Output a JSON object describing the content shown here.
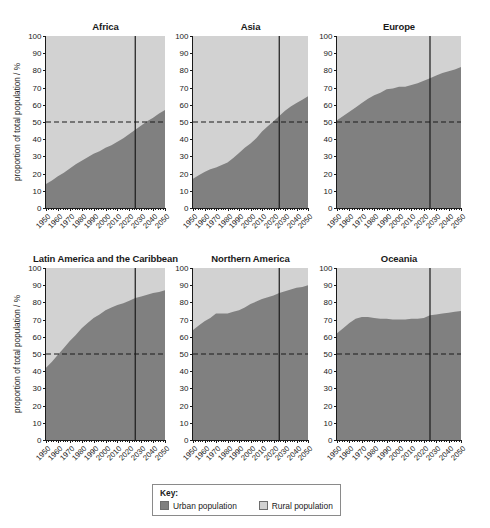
{
  "figure": {
    "ylabel": "proportion of total population / %",
    "y_ticks": [
      "0",
      "10",
      "20",
      "30",
      "40",
      "50",
      "60",
      "70",
      "80",
      "90",
      "100"
    ],
    "x_ticks": [
      "1950",
      "1960",
      "1970",
      "1980",
      "1990",
      "2000",
      "2010",
      "2020",
      "2030",
      "2040",
      "2050"
    ]
  },
  "legend": {
    "title": "Key:",
    "items": [
      {
        "label": "Urban population",
        "color": "#808080"
      },
      {
        "label": "Rural population",
        "color": "#d2d2d2"
      }
    ]
  },
  "colors": {
    "urban": "#808080",
    "rural": "#d2d2d2",
    "axis": "#1a1a1a",
    "reference_line": "#1a1a1a",
    "projection_line": "#1a1a1a"
  },
  "chart_data": [
    {
      "type": "area",
      "title": "Africa",
      "xlabel": "",
      "ylabel": "proportion of total population / %",
      "xlim": [
        1950,
        2050
      ],
      "ylim": [
        0,
        100
      ],
      "grid": false,
      "stacked": true,
      "reference_line_y": 50,
      "projection_line_x": 2025,
      "x": [
        1950,
        1955,
        1960,
        1965,
        1970,
        1975,
        1980,
        1985,
        1990,
        1995,
        2000,
        2005,
        2010,
        2015,
        2020,
        2025,
        2030,
        2035,
        2040,
        2045,
        2050
      ],
      "series": [
        {
          "name": "Urban population",
          "values": [
            14.0,
            16.0,
            18.5,
            20.5,
            23.0,
            25.5,
            27.5,
            29.5,
            31.5,
            33.0,
            35.0,
            36.5,
            38.5,
            40.5,
            43.0,
            45.5,
            48.0,
            50.5,
            52.5,
            55.0,
            57.0
          ]
        },
        {
          "name": "Rural population",
          "values": [
            86.0,
            84.0,
            81.5,
            79.5,
            77.0,
            74.5,
            72.5,
            70.5,
            68.5,
            67.0,
            65.0,
            63.5,
            61.5,
            59.5,
            57.0,
            54.5,
            52.0,
            49.5,
            47.5,
            45.0,
            43.0
          ]
        }
      ]
    },
    {
      "type": "area",
      "title": "Asia",
      "xlabel": "",
      "ylabel": "",
      "xlim": [
        1950,
        2050
      ],
      "ylim": [
        0,
        100
      ],
      "grid": false,
      "stacked": true,
      "reference_line_y": 50,
      "projection_line_x": 2025,
      "x": [
        1950,
        1955,
        1960,
        1965,
        1970,
        1975,
        1980,
        1985,
        1990,
        1995,
        2000,
        2005,
        2010,
        2015,
        2020,
        2025,
        2030,
        2035,
        2040,
        2045,
        2050
      ],
      "series": [
        {
          "name": "Urban population",
          "values": [
            17.0,
            19.0,
            21.0,
            22.5,
            23.5,
            25.0,
            26.5,
            29.0,
            32.0,
            35.0,
            37.5,
            40.5,
            44.5,
            47.5,
            50.5,
            53.5,
            56.5,
            59.0,
            61.0,
            63.0,
            65.0
          ]
        },
        {
          "name": "Rural population",
          "values": [
            83.0,
            81.0,
            79.0,
            77.5,
            76.5,
            75.0,
            73.5,
            71.0,
            68.0,
            65.0,
            62.5,
            59.5,
            55.5,
            52.5,
            49.5,
            46.5,
            43.5,
            41.0,
            39.0,
            37.0,
            35.0
          ]
        }
      ]
    },
    {
      "type": "area",
      "title": "Europe",
      "xlabel": "",
      "ylabel": "",
      "xlim": [
        1950,
        2050
      ],
      "ylim": [
        0,
        100
      ],
      "grid": false,
      "stacked": true,
      "reference_line_y": 50,
      "projection_line_x": 2025,
      "x": [
        1950,
        1955,
        1960,
        1965,
        1970,
        1975,
        1980,
        1985,
        1990,
        1995,
        2000,
        2005,
        2010,
        2015,
        2020,
        2025,
        2030,
        2035,
        2040,
        2045,
        2050
      ],
      "series": [
        {
          "name": "Urban population",
          "values": [
            51.0,
            53.5,
            56.0,
            58.5,
            61.0,
            63.5,
            65.5,
            67.0,
            69.0,
            69.5,
            70.5,
            70.5,
            71.5,
            72.5,
            74.0,
            75.5,
            77.0,
            78.5,
            79.5,
            80.5,
            82.0
          ]
        },
        {
          "name": "Rural population",
          "values": [
            49.0,
            46.5,
            44.0,
            41.5,
            39.0,
            36.5,
            34.5,
            33.0,
            31.0,
            30.5,
            29.5,
            29.5,
            28.5,
            27.5,
            26.0,
            24.5,
            23.0,
            21.5,
            20.5,
            19.5,
            18.0
          ]
        }
      ]
    },
    {
      "type": "area",
      "title": "Latin America and the Caribbean",
      "xlabel": "",
      "ylabel": "proportion of total population / %",
      "xlim": [
        1950,
        2050
      ],
      "ylim": [
        0,
        100
      ],
      "grid": false,
      "stacked": true,
      "reference_line_y": 50,
      "projection_line_x": 2025,
      "x": [
        1950,
        1955,
        1960,
        1965,
        1970,
        1975,
        1980,
        1985,
        1990,
        1995,
        2000,
        2005,
        2010,
        2015,
        2020,
        2025,
        2030,
        2035,
        2040,
        2045,
        2050
      ],
      "series": [
        {
          "name": "Urban population",
          "values": [
            42.0,
            45.5,
            49.5,
            53.5,
            57.5,
            61.0,
            65.0,
            68.0,
            71.0,
            73.0,
            75.5,
            77.0,
            78.5,
            79.5,
            81.0,
            82.5,
            83.5,
            84.5,
            85.5,
            86.0,
            87.0
          ]
        },
        {
          "name": "Rural population",
          "values": [
            58.0,
            54.5,
            50.5,
            46.5,
            42.5,
            39.0,
            35.0,
            32.0,
            29.0,
            27.0,
            24.5,
            23.0,
            21.5,
            20.5,
            19.0,
            17.5,
            16.5,
            15.5,
            14.5,
            14.0,
            13.0
          ]
        }
      ]
    },
    {
      "type": "area",
      "title": "Northern America",
      "xlabel": "",
      "ylabel": "",
      "xlim": [
        1950,
        2050
      ],
      "ylim": [
        0,
        100
      ],
      "grid": false,
      "stacked": true,
      "reference_line_y": 50,
      "projection_line_x": 2025,
      "x": [
        1950,
        1955,
        1960,
        1965,
        1970,
        1975,
        1980,
        1985,
        1990,
        1995,
        2000,
        2005,
        2010,
        2015,
        2020,
        2025,
        2030,
        2035,
        2040,
        2045,
        2050
      ],
      "series": [
        {
          "name": "Urban population",
          "values": [
            64.0,
            66.5,
            69.0,
            71.0,
            73.5,
            73.5,
            73.5,
            74.5,
            75.5,
            77.0,
            79.0,
            80.5,
            82.0,
            83.0,
            84.0,
            85.5,
            86.5,
            87.5,
            88.5,
            89.0,
            90.0
          ]
        },
        {
          "name": "Rural population",
          "values": [
            36.0,
            33.5,
            31.0,
            29.0,
            26.5,
            26.5,
            26.5,
            25.5,
            24.5,
            23.0,
            21.0,
            19.5,
            18.0,
            17.0,
            16.0,
            14.5,
            13.5,
            12.5,
            11.5,
            11.0,
            10.0
          ]
        }
      ]
    },
    {
      "type": "area",
      "title": "Oceania",
      "xlabel": "",
      "ylabel": "",
      "xlim": [
        1950,
        2050
      ],
      "ylim": [
        0,
        100
      ],
      "grid": false,
      "stacked": true,
      "reference_line_y": 50,
      "projection_line_x": 2025,
      "x": [
        1950,
        1955,
        1960,
        1965,
        1970,
        1975,
        1980,
        1985,
        1990,
        1995,
        2000,
        2005,
        2010,
        2015,
        2020,
        2025,
        2030,
        2035,
        2040,
        2045,
        2050
      ],
      "series": [
        {
          "name": "Urban population",
          "values": [
            62.0,
            65.0,
            68.0,
            70.5,
            71.5,
            71.5,
            71.0,
            70.5,
            70.5,
            70.0,
            70.0,
            70.0,
            70.5,
            70.5,
            71.0,
            72.5,
            73.0,
            73.5,
            74.0,
            74.5,
            75.0
          ]
        },
        {
          "name": "Rural population",
          "values": [
            38.0,
            35.0,
            32.0,
            29.5,
            28.5,
            28.5,
            29.0,
            29.5,
            29.5,
            30.0,
            30.0,
            30.0,
            29.5,
            29.5,
            29.0,
            27.5,
            27.0,
            26.5,
            26.0,
            25.5,
            25.0
          ]
        }
      ]
    }
  ]
}
